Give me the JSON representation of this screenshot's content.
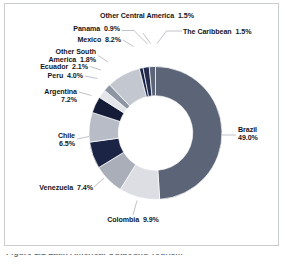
{
  "figure": {
    "frame_border_color": "#c9ccd1",
    "background": "#ffffff",
    "caption_clipped": "Figure 1.1 Latin America: Outbound Tourism"
  },
  "chart_data": {
    "type": "pie",
    "variant": "donut",
    "title": "",
    "subtitle": "",
    "xlabel": "",
    "ylabel": "",
    "units": "percent",
    "total": 100.0,
    "start_angle_deg": 0,
    "direction": "clockwise",
    "inner_radius_ratio": 0.56,
    "legend": "none",
    "labels_position": "outside-with-leader-lines",
    "categories": [
      "Brazil",
      "Colombia",
      "Venezuela",
      "Chile",
      "Argentina",
      "Peru",
      "Ecuador",
      "Other South America",
      "Mexico",
      "Panama",
      "Other Central America",
      "The Caribbean"
    ],
    "values": [
      49.0,
      9.9,
      7.4,
      6.5,
      7.2,
      4.0,
      2.1,
      1.8,
      8.2,
      0.9,
      1.5,
      1.5
    ],
    "value_labels": [
      "49.0%",
      "9.9%",
      "7.4%",
      "6.5%",
      "7.2%",
      "4.0%",
      "2.1%",
      "1.8%",
      "8.2%",
      "0.9%",
      "1.5%",
      "1.5%"
    ],
    "colors": [
      "#5c6478",
      "#dcdee3",
      "#a9aeb8",
      "#1b2444",
      "#b7bcc6",
      "#151c38",
      "#e3e5ea",
      "#8e95a2",
      "#c3c7d0",
      "#1b2444",
      "#232c4e",
      "#5c6478"
    ],
    "slices": [
      {
        "name": "Brazil",
        "value": 49.0,
        "label": "Brazil",
        "value_label": "49.0%",
        "color": "#5c6478"
      },
      {
        "name": "Colombia",
        "value": 9.9,
        "label": "Colombia",
        "value_label": "9.9%",
        "color": "#dcdee3"
      },
      {
        "name": "Venezuela",
        "value": 7.4,
        "label": "Venezuela",
        "value_label": "7.4%",
        "color": "#a9aeb8"
      },
      {
        "name": "Chile",
        "value": 6.5,
        "label": "Chile",
        "value_label": "6.5%",
        "color": "#1b2444"
      },
      {
        "name": "Argentina",
        "value": 7.2,
        "label": "Argentina",
        "value_label": "7.2%",
        "color": "#b7bcc6"
      },
      {
        "name": "Peru",
        "value": 4.0,
        "label": "Peru",
        "value_label": "4.0%",
        "color": "#151c38"
      },
      {
        "name": "Ecuador",
        "value": 2.1,
        "label": "Ecuador",
        "value_label": "2.1%",
        "color": "#e3e5ea"
      },
      {
        "name": "Other South America",
        "value": 1.8,
        "label": "Other South America",
        "value_label": "1.8%",
        "color": "#8e95a2"
      },
      {
        "name": "Mexico",
        "value": 8.2,
        "label": "Mexico",
        "value_label": "8.2%",
        "color": "#c3c7d0"
      },
      {
        "name": "Panama",
        "value": 0.9,
        "label": "Panama",
        "value_label": "0.9%",
        "color": "#1b2444"
      },
      {
        "name": "Other Central America",
        "value": 1.5,
        "label": "Other Central America",
        "value_label": "1.5%",
        "color": "#232c4e"
      },
      {
        "name": "The Caribbean",
        "value": 1.5,
        "label": "The Caribbean",
        "value_label": "1.5%",
        "color": "#5c6478"
      }
    ]
  },
  "callouts": {
    "brazil": {
      "line1": "Brazil",
      "line2": "49.0%"
    },
    "colombia": {
      "text": "Colombia  9.9%"
    },
    "venezuela": {
      "text": "Venezuela  7.4%"
    },
    "chile": {
      "line1": "Chile",
      "line2": "6.5%"
    },
    "argentina": {
      "line1": "Argentina",
      "line2": "7.2%"
    },
    "peru": {
      "text": "Peru  4.0%"
    },
    "ecuador": {
      "text": "Ecuador  2.1%"
    },
    "other_south_america": {
      "line1": "Other South",
      "line2": "America  1.8%"
    },
    "mexico": {
      "text": "Mexico  8.2%"
    },
    "panama": {
      "text": "Panama  0.9%"
    },
    "other_central_america": {
      "text": "Other Central America  1.5%"
    },
    "caribbean": {
      "text": "The Caribbean  1.5%"
    }
  }
}
